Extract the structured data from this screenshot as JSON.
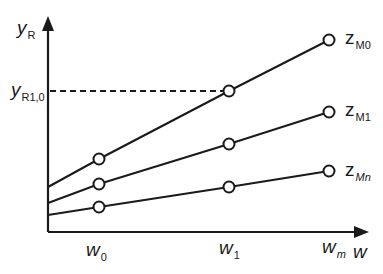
{
  "diagram": {
    "axes": {
      "y_label": {
        "main": "y",
        "sub": "R"
      },
      "x_label": {
        "main": "w",
        "sub": ""
      },
      "color": "#1a1a1a"
    },
    "x_ticks": [
      {
        "main": "w",
        "sub": "0"
      },
      {
        "main": "w",
        "sub": "1"
      },
      {
        "main": "w",
        "sub": "m"
      }
    ],
    "y_marker": {
      "main": "y",
      "sub": "R1,0"
    },
    "lines": [
      {
        "name": "z",
        "sub": "M0",
        "start_y": 187,
        "points": [
          [
            99,
            159
          ],
          [
            229,
            91
          ],
          [
            329,
            40
          ]
        ]
      },
      {
        "name": "z",
        "sub": "M1",
        "start_y": 203,
        "points": [
          [
            99,
            184
          ],
          [
            229,
            144
          ],
          [
            329,
            112
          ]
        ]
      },
      {
        "name": "z",
        "sub": "Mn",
        "start_y": 215,
        "points": [
          [
            99,
            207
          ],
          [
            229,
            187
          ],
          [
            329,
            171
          ]
        ]
      }
    ]
  }
}
